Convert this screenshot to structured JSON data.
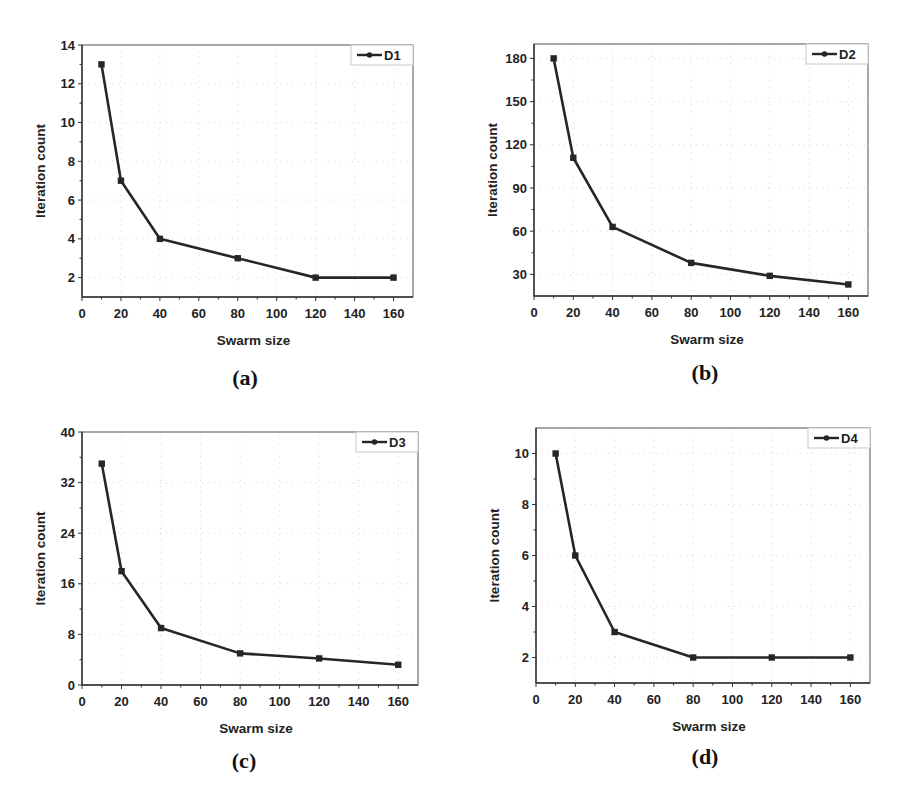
{
  "figure": {
    "panels": [
      {
        "caption": "(a)",
        "legend": "D1"
      },
      {
        "caption": "(b)",
        "legend": "D2"
      },
      {
        "caption": "(c)",
        "legend": "D3"
      },
      {
        "caption": "(d)",
        "legend": "D4"
      }
    ]
  },
  "colors": {
    "line": "#262626",
    "frame": "#6e6e6e",
    "grid": "#d6d6d6",
    "legend_border": "#c8c8c8",
    "text": "#222222"
  },
  "chart_data": [
    {
      "type": "line",
      "panel": "(a)",
      "title": "",
      "xlabel": "Swarm size",
      "ylabel": "Iteration count",
      "xlim": [
        0,
        170
      ],
      "ylim": [
        1,
        14
      ],
      "xticks": [
        0,
        20,
        40,
        60,
        80,
        100,
        120,
        140,
        160
      ],
      "xtick_labels": [
        "0",
        "20",
        "40",
        "60",
        "80",
        "100",
        "120",
        "140",
        "160"
      ],
      "yticks": [
        2,
        4,
        6,
        8,
        10,
        12,
        14
      ],
      "ytick_labels": [
        "2",
        "4",
        "6",
        "8",
        "10",
        "12",
        "14"
      ],
      "grid": true,
      "legend_position": "upper right",
      "x": [
        10,
        20,
        40,
        80,
        120,
        160
      ],
      "series": [
        {
          "name": "D1",
          "values": [
            13,
            7,
            4,
            3,
            2,
            2
          ]
        }
      ]
    },
    {
      "type": "line",
      "panel": "(b)",
      "title": "",
      "xlabel": "Swarm size",
      "ylabel": "Iteration count",
      "xlim": [
        0,
        170
      ],
      "ylim": [
        15,
        190
      ],
      "xticks": [
        0,
        20,
        40,
        60,
        80,
        100,
        120,
        140,
        160
      ],
      "xtick_labels": [
        "0",
        "20",
        "40",
        "60",
        "80",
        "100",
        "120",
        "140",
        "160"
      ],
      "yticks": [
        30,
        60,
        90,
        120,
        150,
        180
      ],
      "ytick_labels": [
        "30",
        "60",
        "90",
        "120",
        "150",
        "180"
      ],
      "grid": true,
      "legend_position": "upper right",
      "x": [
        10,
        20,
        40,
        80,
        120,
        160
      ],
      "series": [
        {
          "name": "D2",
          "values": [
            180,
            111,
            63,
            38,
            29,
            23
          ]
        }
      ]
    },
    {
      "type": "line",
      "panel": "(c)",
      "title": "",
      "xlabel": "Swarm size",
      "ylabel": "Iteration count",
      "xlim": [
        0,
        170
      ],
      "ylim": [
        0,
        40
      ],
      "xticks": [
        0,
        20,
        40,
        60,
        80,
        100,
        120,
        140,
        160
      ],
      "xtick_labels": [
        "0",
        "20",
        "40",
        "60",
        "80",
        "100",
        "120",
        "140",
        "160"
      ],
      "yticks": [
        0,
        8,
        16,
        24,
        32,
        40
      ],
      "ytick_labels": [
        "0",
        "8",
        "16",
        "24",
        "32",
        "40"
      ],
      "grid": true,
      "legend_position": "upper right",
      "x": [
        10,
        20,
        40,
        80,
        120,
        160
      ],
      "series": [
        {
          "name": "D3",
          "values": [
            35,
            18,
            9,
            5,
            4.2,
            3.2
          ]
        }
      ]
    },
    {
      "type": "line",
      "panel": "(d)",
      "title": "",
      "xlabel": "Swarm size",
      "ylabel": "Iteration count",
      "xlim": [
        0,
        170
      ],
      "ylim": [
        1,
        11
      ],
      "xticks": [
        0,
        20,
        40,
        60,
        80,
        100,
        120,
        140,
        160
      ],
      "xtick_labels": [
        "0",
        "20",
        "40",
        "60",
        "80",
        "100",
        "120",
        "140",
        "160"
      ],
      "yticks": [
        2,
        4,
        6,
        8,
        10
      ],
      "ytick_labels": [
        "2",
        "4",
        "6",
        "8",
        "10"
      ],
      "grid": true,
      "legend_position": "upper right",
      "x": [
        10,
        20,
        40,
        80,
        120,
        160
      ],
      "series": [
        {
          "name": "D4",
          "values": [
            10,
            6,
            3,
            2,
            2,
            2
          ]
        }
      ]
    }
  ]
}
